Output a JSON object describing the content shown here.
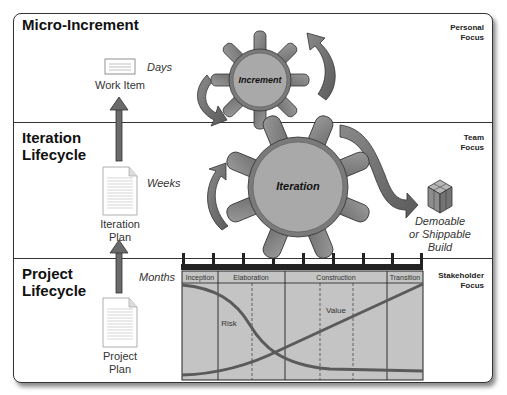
{
  "sections": {
    "micro_increment": {
      "title": "Micro-Increment",
      "focus": [
        "Personal",
        "Focus"
      ],
      "cadence": "Days",
      "artifact": [
        "Work Item"
      ]
    },
    "iteration_lifecycle": {
      "title_lines": [
        "Iteration",
        "Lifecycle"
      ],
      "focus": [
        "Team",
        "Focus"
      ],
      "cadence": "Weeks",
      "artifact": [
        "Iteration",
        "Plan"
      ]
    },
    "project_lifecycle": {
      "title_lines": [
        "Project",
        "Lifecycle"
      ],
      "focus": [
        "Stakeholder",
        "Focus"
      ],
      "cadence": "Months",
      "artifact": [
        "Project",
        "Plan"
      ]
    }
  },
  "gears": {
    "increment": {
      "label": "Increment"
    },
    "iteration": {
      "label": "Iteration"
    }
  },
  "build": {
    "label_lines": [
      "Demoable",
      "or Shippable",
      "Build"
    ]
  },
  "phase_chart": {
    "phases": [
      "Inception",
      "Elaboration",
      "Construction",
      "Transition"
    ],
    "curves": {
      "risk": "Risk",
      "value": "Value"
    }
  },
  "colors": {
    "gear_fill": "#8a8a8a",
    "gear_body": "#a9a9a9",
    "chart_fill": "#c4c4c4",
    "curve": "#5a5a5a",
    "arrow": "#6d6d6d",
    "border": "#333333"
  }
}
